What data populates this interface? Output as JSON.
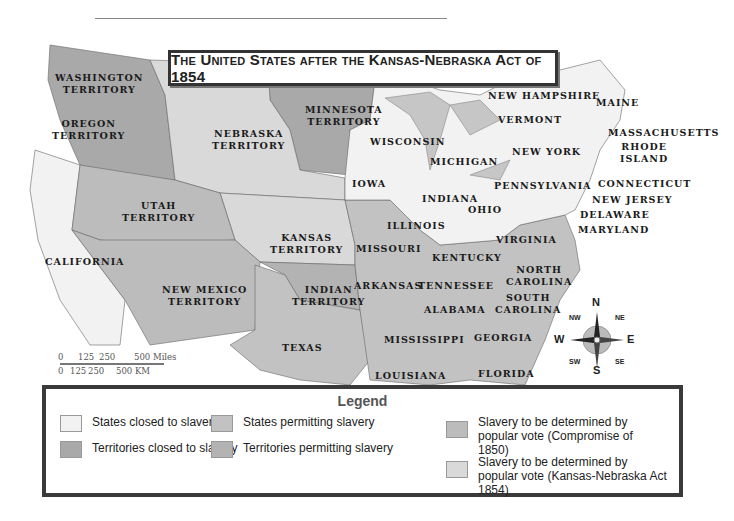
{
  "title": "The United States after the Kansas-Nebraska Act of 1854",
  "colors": {
    "states_closed": "#f2f2f2",
    "territories_closed": "#a9a9a9",
    "states_permitting": "#c2c2c2",
    "territories_permitting": "#b3b3b3",
    "popular_vote_1850": "#bcbcbc",
    "popular_vote_1854": "#d9d9d9",
    "water": "#c6c6c6",
    "border": "#666666"
  },
  "regions": {
    "washington": "WASHINGTON\nTERRITORY",
    "oregon": "OREGON\nTERRITORY",
    "california": "CALIFORNIA",
    "utah": "UTAH\nTERRITORY",
    "nebraska": "NEBRASKA\nTERRITORY",
    "minnesota": "MINNESOTA\nTERRITORY",
    "kansas": "KANSAS\nTERRITORY",
    "new_mexico": "NEW MEXICO\nTERRITORY",
    "indian": "INDIAN\nTERRITORY",
    "texas": "TEXAS",
    "iowa": "IOWA",
    "missouri": "MISSOURI",
    "arkansas": "ARKANSAS",
    "louisiana": "LOUISIANA",
    "mississippi": "MISSISSIPPI",
    "alabama": "ALABAMA",
    "georgia": "GEORGIA",
    "florida": "FLORIDA",
    "tennessee": "TENNESSEE",
    "kentucky": "KENTUCKY",
    "south_carolina": "SOUTH\nCAROLINA",
    "north_carolina": "NORTH\nCAROLINA",
    "virginia": "VIRGINIA",
    "wisconsin": "WISCONSIN",
    "michigan": "MICHIGAN",
    "illinois": "ILLINOIS",
    "indiana": "INDIANA",
    "ohio": "OHIO",
    "pennsylvania": "PENNSYLVANIA",
    "new_york": "NEW YORK",
    "vermont": "VERMONT",
    "new_hampshire": "NEW HAMPSHIRE",
    "maine": "MAINE",
    "massachusetts": "MASSACHUSETTS",
    "rhode_island": "RHODE\nISLAND",
    "connecticut": "CONNECTICUT",
    "new_jersey": "NEW JERSEY",
    "delaware": "DELAWARE",
    "maryland": "MARYLAND"
  },
  "scale": {
    "miles_ticks": [
      "0",
      "125",
      "250",
      "500 Miles"
    ],
    "km_ticks": [
      "0",
      "125",
      "250",
      "500 KM"
    ]
  },
  "compass": {
    "n": "N",
    "s": "S",
    "e": "E",
    "w": "W",
    "ne": "NE",
    "nw": "NW",
    "se": "SE",
    "sw": "SW"
  },
  "legend": {
    "title": "Legend",
    "items": [
      {
        "label": "States closed to slavery",
        "color": "#f2f2f2"
      },
      {
        "label": "Territories closed to slavery",
        "color": "#a9a9a9"
      },
      {
        "label": "States permitting slavery",
        "color": "#c2c2c2"
      },
      {
        "label": "Territories permitting slavery",
        "color": "#b3b3b3"
      },
      {
        "label": "Slavery to be determined by popular vote (Compromise of 1850)",
        "color": "#bcbcbc"
      },
      {
        "label": "Slavery to be determined by popular vote (Kansas-Nebraska Act 1854)",
        "color": "#d9d9d9"
      }
    ]
  }
}
